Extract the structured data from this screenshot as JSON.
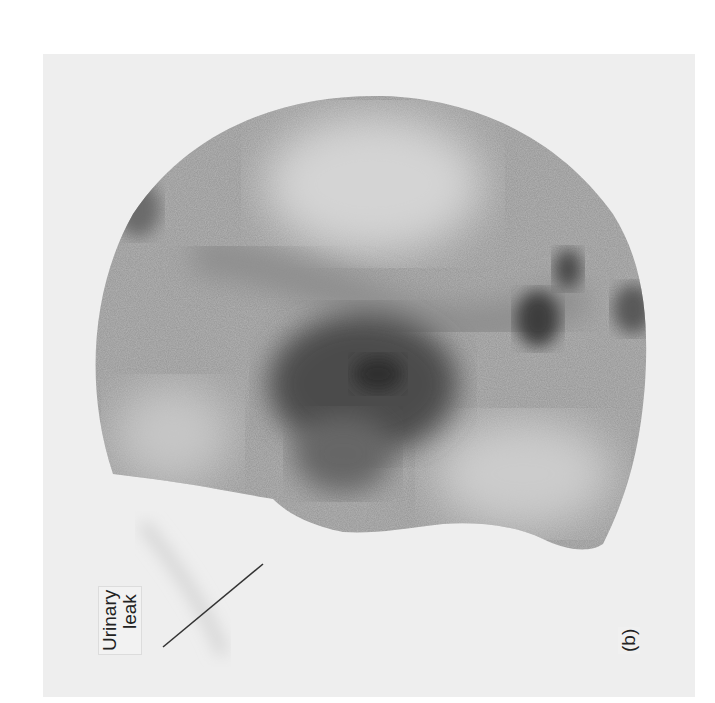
{
  "figure": {
    "panel_label": "(b)",
    "annotation": {
      "line1": "Urinary",
      "line2": "leak"
    },
    "colors": {
      "background": "#ffffff",
      "panel": "#eeeeee",
      "activity_dark": "#3a3a3a",
      "activity_mid": "#8a8a8a",
      "field": "#b8b8b8"
    }
  }
}
